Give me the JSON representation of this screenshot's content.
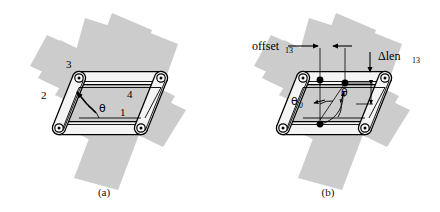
{
  "figure": {
    "type": "technical-diagram",
    "background_color": "#cccccc",
    "line_color": "#000000",
    "link_fill_color": "#f2f2f2",
    "page_color": "#ffffff"
  },
  "panel_a": {
    "caption": "(a)",
    "link_labels": {
      "link1": "1",
      "link2": "2",
      "link3": "3",
      "link4": "4"
    },
    "angle_label": "θ"
  },
  "panel_b": {
    "caption": "(b)",
    "offset_label": "offset",
    "offset_subscript": "13",
    "dlen_label": "Δlen",
    "dlen_subscript": "13",
    "theta_zero_label": "θ",
    "theta_zero_subscript": "0",
    "theta_label": "θ"
  }
}
